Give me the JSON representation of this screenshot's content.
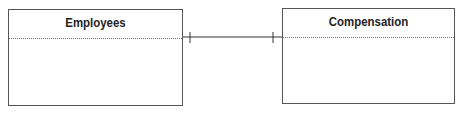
{
  "diagram": {
    "type": "entity-relationship",
    "entities": [
      {
        "name": "Employees"
      },
      {
        "name": "Compensation"
      }
    ],
    "relationship": {
      "from": "Employees",
      "to": "Compensation",
      "from_cardinality": "one",
      "to_cardinality": "one"
    },
    "colors": {
      "line": "#333333",
      "border": "#555555",
      "divider": "#777777"
    }
  }
}
